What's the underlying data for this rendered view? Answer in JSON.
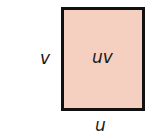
{
  "diagram": {
    "type": "rectangle-area",
    "fill_color": "#f5cfc0",
    "border_color": "#111111",
    "area_label": "uv",
    "height_label": "v",
    "width_label": "u"
  }
}
